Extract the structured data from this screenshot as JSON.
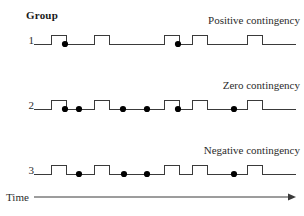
{
  "figure": {
    "group_header": "Group",
    "time_label": "Time",
    "line_color": "#3a3a3a",
    "dot_color": "#000000",
    "background": "#ffffff"
  },
  "rows": [
    {
      "number": "1",
      "condition_label": "Positive contingency",
      "baseline_y": 18,
      "pulse_height": 9,
      "pulses": [
        {
          "start": 51,
          "end": 66
        },
        {
          "start": 94,
          "end": 109
        },
        {
          "start": 164,
          "end": 179
        },
        {
          "start": 192,
          "end": 207
        },
        {
          "start": 247,
          "end": 262
        }
      ],
      "dots": [
        65,
        178
      ]
    },
    {
      "number": "2",
      "condition_label": "Zero contingency",
      "baseline_y": 18,
      "pulse_height": 9,
      "pulses": [
        {
          "start": 51,
          "end": 66
        },
        {
          "start": 94,
          "end": 109
        },
        {
          "start": 164,
          "end": 179
        },
        {
          "start": 192,
          "end": 207
        },
        {
          "start": 247,
          "end": 262
        }
      ],
      "dots": [
        65,
        79,
        123,
        147,
        178,
        234
      ]
    },
    {
      "number": "3",
      "condition_label": "Negative contingency",
      "baseline_y": 18,
      "pulse_height": 9,
      "pulses": [
        {
          "start": 51,
          "end": 66
        },
        {
          "start": 94,
          "end": 109
        },
        {
          "start": 164,
          "end": 179
        },
        {
          "start": 192,
          "end": 207
        },
        {
          "start": 247,
          "end": 262
        }
      ],
      "dots": [
        79,
        124,
        147,
        234
      ]
    }
  ],
  "time_axis": {
    "x_start": 34,
    "x_end": 296,
    "y": 11
  },
  "chart_data": {
    "type": "line",
    "title": "",
    "xlabel": "Time",
    "ylabel": "Group",
    "grid": false,
    "legend": "none",
    "series": [
      {
        "name": "Positive contingency",
        "group": "1",
        "event_pulses": [
          51,
          94,
          164,
          192,
          247
        ],
        "outcome_dots": [
          65,
          178
        ],
        "description": "Outcomes occur only during cue pulses"
      },
      {
        "name": "Zero contingency",
        "group": "2",
        "event_pulses": [
          51,
          94,
          164,
          192,
          247
        ],
        "outcome_dots": [
          65,
          79,
          123,
          147,
          178,
          234
        ],
        "description": "Outcomes occur both during and between cue pulses"
      },
      {
        "name": "Negative contingency",
        "group": "3",
        "event_pulses": [
          51,
          94,
          164,
          192,
          247
        ],
        "outcome_dots": [
          79,
          124,
          147,
          234
        ],
        "description": "Outcomes occur only between cue pulses"
      }
    ]
  }
}
